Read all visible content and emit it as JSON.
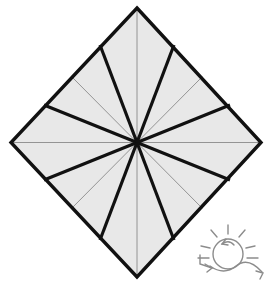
{
  "figure": {
    "canvas": {
      "width": 268,
      "height": 284
    },
    "colors": {
      "background": "#ffffff",
      "paper_fill": "#e8e8e8",
      "mountain_fold_stroke": "#111111",
      "reference_crease_stroke": "#8a8a8a",
      "outline_stroke": "#111111",
      "symbol_stroke": "#8c8c8c"
    },
    "stroke_widths": {
      "outline": 3.4,
      "mountain_fold": 3.2,
      "reference_crease": 0.9,
      "symbol": 1.4
    }
  },
  "paper": {
    "name": "square-sheet",
    "shape": "diamond",
    "center": {
      "x": 137,
      "y": 142.5
    },
    "vertices": [
      {
        "name": "top",
        "x": 137,
        "y": 8
      },
      {
        "name": "right",
        "x": 261,
        "y": 142.5
      },
      {
        "name": "bottom",
        "x": 137,
        "y": 277
      },
      {
        "name": "left",
        "x": 11,
        "y": 142.5
      }
    ]
  },
  "creases": {
    "reference": [
      {
        "name": "vertical-axis",
        "from": {
          "x": 137,
          "y": 8
        },
        "to": {
          "x": 137,
          "y": 277
        }
      },
      {
        "name": "horizontal-axis",
        "from": {
          "x": 11,
          "y": 142.5
        },
        "to": {
          "x": 261,
          "y": 142.5
        }
      },
      {
        "name": "ray-upper-left-thin",
        "from": {
          "x": 137,
          "y": 142.5
        },
        "to": {
          "x": 72,
          "y": 77
        }
      },
      {
        "name": "ray-upper-right-thin",
        "from": {
          "x": 137,
          "y": 142.5
        },
        "to": {
          "x": 202,
          "y": 77
        }
      },
      {
        "name": "ray-lower-left-thin",
        "from": {
          "x": 137,
          "y": 142.5
        },
        "to": {
          "x": 72,
          "y": 208
        }
      },
      {
        "name": "ray-lower-right-thin",
        "from": {
          "x": 137,
          "y": 142.5
        },
        "to": {
          "x": 202,
          "y": 208
        }
      }
    ],
    "mountain": [
      {
        "name": "fold-1-up-left-steep",
        "from": {
          "x": 137,
          "y": 142.5
        },
        "to": {
          "x": 100,
          "y": 45
        }
      },
      {
        "name": "fold-2-up-left-shallow",
        "from": {
          "x": 137,
          "y": 142.5
        },
        "to": {
          "x": 44,
          "y": 105
        }
      },
      {
        "name": "fold-3-left-shallow",
        "from": {
          "x": 137,
          "y": 142.5
        },
        "to": {
          "x": 44,
          "y": 180
        }
      },
      {
        "name": "fold-4-down-left-steep",
        "from": {
          "x": 137,
          "y": 142.5
        },
        "to": {
          "x": 100,
          "y": 240
        }
      },
      {
        "name": "fold-5-down-right-steep",
        "from": {
          "x": 137,
          "y": 142.5
        },
        "to": {
          "x": 174,
          "y": 240
        }
      },
      {
        "name": "fold-6-right-shallow",
        "from": {
          "x": 137,
          "y": 142.5
        },
        "to": {
          "x": 230,
          "y": 180
        }
      },
      {
        "name": "fold-7-up-right-shallow",
        "from": {
          "x": 137,
          "y": 142.5
        },
        "to": {
          "x": 230,
          "y": 105
        }
      },
      {
        "name": "fold-8-up-right-steep",
        "from": {
          "x": 137,
          "y": 142.5
        },
        "to": {
          "x": 174,
          "y": 45
        }
      }
    ]
  },
  "rotate_symbol": {
    "name": "rotate-and-turn-over-symbol",
    "label": "turn over / rotate",
    "circle": {
      "cx": 36,
      "cy": 32,
      "r": 15
    },
    "ray_count": 6,
    "arrow_count": 3
  }
}
